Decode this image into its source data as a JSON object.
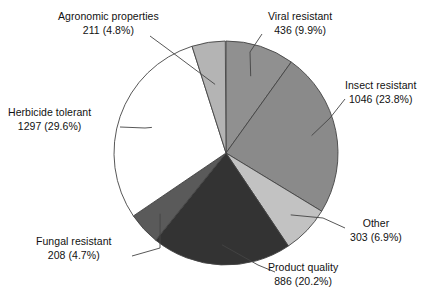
{
  "chart_data": {
    "type": "pie",
    "title": "",
    "subtitle": "",
    "xlabel": "",
    "ylabel": "",
    "legend_position": "none",
    "grid": false,
    "total": 4387,
    "start_angle_deg": 0,
    "direction": "clockwise",
    "categories": [
      "Viral resistant",
      "Insect resistant",
      "Other",
      "Product quality",
      "Fungal resistant",
      "Herbicide tolerant",
      "Agronomic properties"
    ],
    "values": [
      436,
      1046,
      303,
      886,
      208,
      1297,
      211
    ],
    "percents": [
      9.9,
      23.8,
      6.9,
      20.2,
      4.7,
      29.6,
      4.8
    ],
    "colors": [
      "#909090",
      "#8a8a8a",
      "#c2c2c2",
      "#333333",
      "#5a5a5a",
      "#ffffff",
      "#b4b4b4"
    ],
    "slices": [
      {
        "label": "Viral resistant",
        "value": 436,
        "percent": 9.9,
        "value_text": "436",
        "percent_text": "(9.9%)",
        "color": "#909090"
      },
      {
        "label": "Insect resistant",
        "value": 1046,
        "percent": 23.8,
        "value_text": "1046",
        "percent_text": "(23.8%)",
        "color": "#8a8a8a"
      },
      {
        "label": "Other",
        "value": 303,
        "percent": 6.9,
        "value_text": "303",
        "percent_text": "(6.9%)",
        "color": "#c2c2c2"
      },
      {
        "label": "Product quality",
        "value": 886,
        "percent": 20.2,
        "value_text": "886",
        "percent_text": "(20.2%)",
        "color": "#333333"
      },
      {
        "label": "Fungal resistant",
        "value": 208,
        "percent": 4.7,
        "value_text": "208",
        "percent_text": "(4.7%)",
        "color": "#5a5a5a"
      },
      {
        "label": "Herbicide tolerant",
        "value": 1297,
        "percent": 29.6,
        "value_text": "1297",
        "percent_text": "(29.6%)",
        "color": "#ffffff"
      },
      {
        "label": "Agronomic properties",
        "value": 211,
        "percent": 4.8,
        "value_text": "211",
        "percent_text": "(4.8%)",
        "color": "#b4b4b4"
      }
    ]
  },
  "labels": {
    "agronomic": {
      "name": "Agronomic properties",
      "value": "211 (4.8%)"
    },
    "viral": {
      "name": "Viral resistant",
      "value": "436 (9.9%)"
    },
    "insect": {
      "name": "Insect resistant",
      "value": "1046 (23.8%)"
    },
    "other": {
      "name": "Other",
      "value": "303 (6.9%)"
    },
    "product": {
      "name": "Product quality",
      "value": "886 (20.2%)"
    },
    "fungal": {
      "name": "Fungal resistant",
      "value": "208 (4.7%)"
    },
    "herbicide": {
      "name": "Herbicide tolerant",
      "value": "1297 (29.6%)"
    }
  },
  "geometry": {
    "center_x": 226,
    "center_y": 153,
    "radius": 112
  },
  "style": {
    "outline_color": "#444444",
    "text_color": "#111111",
    "background": "#ffffff"
  }
}
